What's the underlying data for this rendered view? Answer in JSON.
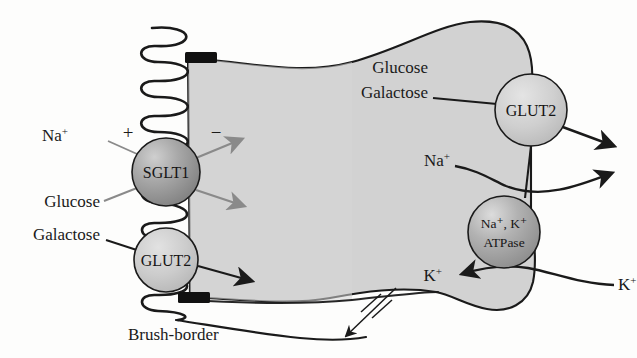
{
  "figure": {
    "background_color": "#fdfdfc",
    "cell_fill_color": "#d2d2d2",
    "outline_color": "#1a1a1a"
  },
  "cell": {
    "name": "enterocyte",
    "fill": "#d2d2d2",
    "stroke": "#1a1a1a"
  },
  "membrane": {
    "brush_border_label": "Brush-border",
    "tight_junction_color": "#111111",
    "apical_side_charge": "+",
    "basal_side_charge": "−"
  },
  "transporters": [
    {
      "id": "sglt1",
      "label": "SGLT1",
      "location": "apical",
      "fill_dark": "#8c8c8c",
      "fill_light": "#cfcfcf",
      "cx": 166,
      "cy": 172,
      "r": 34
    },
    {
      "id": "glut2-apical",
      "label": "GLUT2",
      "location": "apical",
      "fill_dark": "#b9b9b9",
      "fill_light": "#dcdcdc",
      "cx": 166,
      "cy": 260,
      "r": 32
    },
    {
      "id": "glut2-basolateral",
      "label": "GLUT2",
      "location": "basolateral",
      "fill_dark": "#bdbdbd",
      "fill_light": "#dedede",
      "cx": 531,
      "cy": 110,
      "r": 36
    },
    {
      "id": "na-k-atpase",
      "label_line1": "Na⁺, K⁺",
      "label_line2": "ATPase",
      "location": "basolateral",
      "fill_dark": "#9a9a9a",
      "fill_light": "#d6d6d6",
      "cx": 504,
      "cy": 232,
      "r": 36
    }
  ],
  "labels": {
    "na_apical": "Na",
    "na_apical_sup": "+",
    "glucose_apical": "Glucose",
    "galactose_apical": "Galactose",
    "brush_border": "Brush-border",
    "glucose_basal": "Glucose",
    "galactose_basal": "Galactose",
    "na_basal": "Na",
    "na_basal_sup": "+",
    "k_inside": "K",
    "k_inside_sup": "+",
    "k_outside": "K",
    "k_outside_sup": "+",
    "plus_sign": "+",
    "minus_sign": "−"
  },
  "arrows": [
    {
      "id": "sglt1-out-upper",
      "color": "#8a8a8a",
      "description": "SGLT1 to cytosol upper"
    },
    {
      "id": "sglt1-out-lower",
      "color": "#8a8a8a",
      "description": "SGLT1 to cytosol lower"
    },
    {
      "id": "glut2-apical-out",
      "color": "#1a1a1a",
      "description": "apical GLUT2 to cytosol"
    },
    {
      "id": "glut2-basal-out",
      "color": "#1a1a1a",
      "description": "basolateral GLUT2 to blood"
    },
    {
      "id": "na-efflux",
      "color": "#1a1a1a",
      "description": "Na+ out via ATPase"
    },
    {
      "id": "k-influx",
      "color": "#1a1a1a",
      "description": "K+ into cell via ATPase"
    },
    {
      "id": "paracellular-blocked",
      "color": "#1a1a1a",
      "description": "blocked paracellular route with two slashes"
    }
  ]
}
